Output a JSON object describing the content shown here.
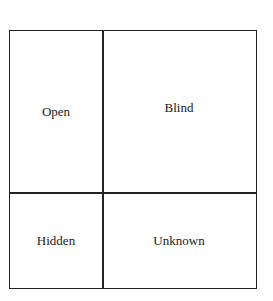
{
  "diagram": {
    "type": "johari-window",
    "quadrants": [
      {
        "id": "open",
        "label": "Open",
        "position": "top-left"
      },
      {
        "id": "blind",
        "label": "Blind",
        "position": "top-right"
      },
      {
        "id": "hidden",
        "label": "Hidden",
        "position": "bottom-left"
      },
      {
        "id": "unknown",
        "label": "Unknown",
        "position": "bottom-right"
      }
    ],
    "colors": {
      "line": "#222222",
      "background": "#ffffff",
      "text": "#1a1a1a"
    }
  }
}
